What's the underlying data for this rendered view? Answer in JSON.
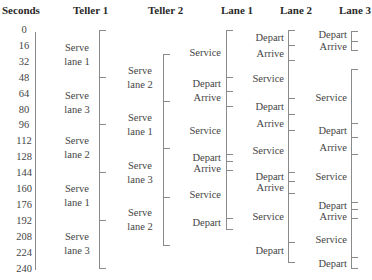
{
  "headers": {
    "seconds": "Seconds",
    "teller1": "Teller 1",
    "teller2": "Teller 2",
    "lane1": "Lane 1",
    "lane2": "Lane 2",
    "lane3": "Lane 3"
  },
  "seconds_ticks": [
    "0",
    "16",
    "32",
    "48",
    "64",
    "80",
    "96",
    "112",
    "128",
    "144",
    "160",
    "176",
    "192",
    "208",
    "224",
    "240"
  ],
  "teller1": {
    "labels": [
      {
        "line1": "Serve",
        "line2": "lane 1"
      },
      {
        "line1": "Serve",
        "line2": "lane 3"
      },
      {
        "line1": "Serve",
        "line2": "lane 2"
      },
      {
        "line1": "Serve",
        "line2": "lane 1"
      },
      {
        "line1": "Serve",
        "line2": "lane 3"
      }
    ]
  },
  "teller2": {
    "labels": [
      {
        "line1": "Serve",
        "line2": "lane 2"
      },
      {
        "line1": "Serve",
        "line2": "lane 1"
      },
      {
        "line1": "Serve",
        "line2": "lane 3"
      },
      {
        "line1": "Serve",
        "line2": "lane 2"
      }
    ]
  },
  "lane1": {
    "labels": [
      "Service",
      "Depart",
      "Arrive",
      "Service",
      "Depart",
      "Arrive",
      "Service",
      "Depart"
    ]
  },
  "lane2": {
    "labels": [
      "Depart",
      "Arrive",
      "Service",
      "Depart",
      "Arrive",
      "Service",
      "Depart",
      "Arrive",
      "Service",
      "Depart"
    ]
  },
  "lane3": {
    "labels": [
      "Depart",
      "Arrive",
      "Service",
      "Depart",
      "Arrive",
      "Service",
      "Depart",
      "Arrive",
      "Service",
      "Depart"
    ]
  }
}
